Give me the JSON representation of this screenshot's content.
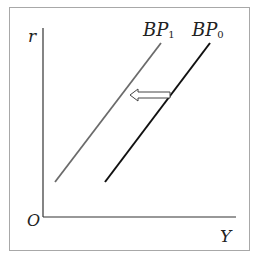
{
  "diagram": {
    "axes": {
      "y_label": "r",
      "x_label": "Y",
      "origin_label": "O"
    },
    "curves": [
      {
        "name": "BP",
        "subscript": "1",
        "color": "#6b6b6b"
      },
      {
        "name": "BP",
        "subscript": "0",
        "color": "#111111"
      }
    ],
    "arrow": {
      "direction": "left",
      "meaning": "shift from BP0 to BP1"
    },
    "colors": {
      "frame": "#a8a8a8",
      "axis": "#333333"
    }
  }
}
